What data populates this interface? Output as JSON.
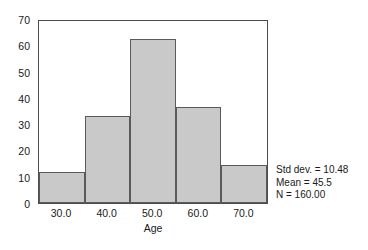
{
  "chart_data": {
    "type": "bar",
    "title": "",
    "subtitle": "",
    "xlabel": "Age",
    "ylabel": "",
    "categories": [
      "30.0",
      "40.0",
      "50.0",
      "60.0",
      "70.0"
    ],
    "values": [
      12,
      33.5,
      63,
      37,
      14.5
    ],
    "x_tick_labels": [
      "30.0",
      "40.0",
      "50.0",
      "60.0",
      "70.0"
    ],
    "y_tick_labels": [
      "0",
      "10",
      "20",
      "30",
      "40",
      "50",
      "60",
      "70"
    ],
    "y_ticks": [
      0,
      10,
      20,
      30,
      40,
      50,
      60,
      70
    ],
    "ylim": [
      0,
      70
    ],
    "bin_width": 10,
    "grid": false,
    "legend": false,
    "bar_fill_color": "#c9c9c9",
    "bar_edge_color": "#5a5a5a",
    "frame_color": "#4d4d4d",
    "annotations": [
      "Std dev. = 10.48",
      "Mean = 45.5",
      "N = 160.00"
    ]
  }
}
